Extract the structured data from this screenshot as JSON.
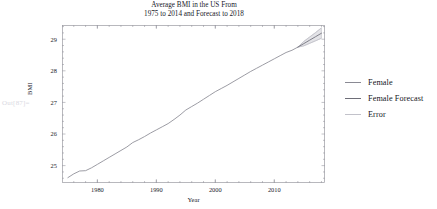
{
  "notebook": {
    "out_label": "Out[87]="
  },
  "chart_data": {
    "type": "line",
    "title": "Average BMI in the US From\n1975 to 2014 and Forecast to 2018",
    "xlabel": "Year",
    "ylabel": "BMI",
    "xlim": [
      1974,
      2018.6
    ],
    "ylim": [
      24.45,
      29.45
    ],
    "xticks": [
      1980,
      1990,
      2000,
      2010
    ],
    "xtick_labels": [
      "1980",
      "1990",
      "2000",
      "2010"
    ],
    "yticks": [
      25,
      26,
      27,
      28,
      29
    ],
    "ytick_labels": [
      "25",
      "26",
      "27",
      "28",
      "29"
    ],
    "grid": false,
    "legend_position": "right",
    "colors": {
      "female": "#8a8a94",
      "female_forecast": "#6e6e78",
      "error": "#c2c2ca",
      "frame": "#9a9aa2",
      "text": "#20202a"
    },
    "series": [
      {
        "name": "Female",
        "color": "#8a8a94",
        "x": [
          1975,
          1976,
          1977,
          1978,
          1979,
          1980,
          1981,
          1982,
          1983,
          1984,
          1985,
          1986,
          1987,
          1988,
          1989,
          1990,
          1991,
          1992,
          1993,
          1994,
          1995,
          1996,
          1997,
          1998,
          1999,
          2000,
          2001,
          2002,
          2003,
          2004,
          2005,
          2006,
          2007,
          2008,
          2009,
          2010,
          2011,
          2012,
          2013,
          2014
        ],
        "values": [
          24.62,
          24.74,
          24.83,
          24.84,
          24.93,
          25.04,
          25.15,
          25.26,
          25.37,
          25.48,
          25.59,
          25.73,
          25.82,
          25.92,
          26.03,
          26.13,
          26.23,
          26.33,
          26.46,
          26.6,
          26.76,
          26.87,
          26.98,
          27.1,
          27.22,
          27.34,
          27.44,
          27.54,
          27.65,
          27.76,
          27.87,
          27.98,
          28.08,
          28.18,
          28.28,
          28.38,
          28.48,
          28.58,
          28.65,
          28.75
        ]
      },
      {
        "name": "Female Forecast",
        "color": "#6e6e78",
        "x": [
          2014,
          2015,
          2016,
          2017,
          2018
        ],
        "values": [
          28.75,
          28.86,
          28.97,
          29.08,
          29.19
        ]
      },
      {
        "name": "Error",
        "color": "#c2c2ca",
        "x": [
          2014,
          2015,
          2016,
          2017,
          2018
        ],
        "upper": [
          28.75,
          28.93,
          29.07,
          29.21,
          29.36
        ],
        "lower": [
          28.75,
          28.79,
          28.87,
          28.95,
          29.03
        ]
      }
    ]
  },
  "legend": {
    "items": [
      {
        "label": "Female",
        "color": "#8a8a94"
      },
      {
        "label": "Female Forecast",
        "color": "#6e6e78"
      },
      {
        "label": "Error",
        "color": "#c2c2ca"
      }
    ]
  }
}
